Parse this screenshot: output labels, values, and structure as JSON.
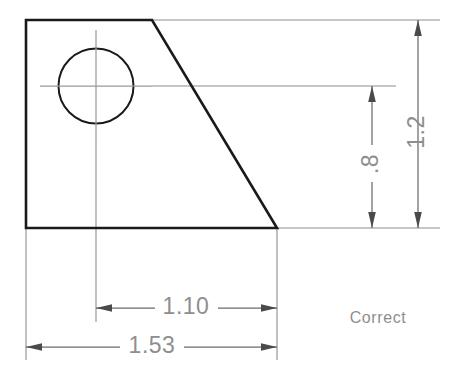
{
  "drawing": {
    "title": "Correct dimensioning example",
    "background_color": "#ffffff",
    "outline_color": "#1a1a1a",
    "dimension_color": "#8e8e8e",
    "centerline_color": "#9a9a9a"
  },
  "note": {
    "label": "Correct",
    "x": 378,
    "y": 319
  },
  "part": {
    "name": "bracket-profile",
    "vertices": [
      {
        "x": 26,
        "y": 20
      },
      {
        "x": 152,
        "y": 20
      },
      {
        "x": 277,
        "y": 228
      },
      {
        "x": 26,
        "y": 228
      }
    ],
    "points_attr": "26,20 152,20 277,228 26,228"
  },
  "hole": {
    "name": "through-hole",
    "center_x": 96,
    "center_y": 86,
    "radius": 37.5
  },
  "centerlines": {
    "horizontal": {
      "x1": 40,
      "y1": 86,
      "x2": 152,
      "y2": 86
    },
    "vertical": {
      "x1": 96,
      "y1": 30,
      "x2": 96,
      "y2": 142
    }
  },
  "extension_lines": [
    {
      "name": "top-extension",
      "x1": 152,
      "y1": 20,
      "x2": 440,
      "y2": 20
    },
    {
      "name": "center-extension",
      "x1": 152,
      "y1": 86,
      "x2": 396,
      "y2": 86
    },
    {
      "name": "bottom-extension",
      "x1": 277,
      "y1": 228,
      "x2": 440,
      "y2": 228
    },
    {
      "name": "hole-center-vertical-extension",
      "x1": 96,
      "y1": 142,
      "x2": 96,
      "y2": 322
    },
    {
      "name": "right-edge-vertical-extension",
      "x1": 277,
      "y1": 228,
      "x2": 277,
      "y2": 360
    },
    {
      "name": "left-edge-vertical-extension",
      "x1": 26,
      "y1": 228,
      "x2": 26,
      "y2": 360
    }
  ],
  "dimensions": [
    {
      "name": "overall-height",
      "value": "1.2",
      "orientation": "vertical",
      "line_x": 418,
      "y_start": 20,
      "y_end": 228,
      "text_x": 418,
      "text_y": 132,
      "rotation": -90
    },
    {
      "name": "hole-center-height",
      "value": ".8",
      "orientation": "vertical",
      "line_x": 372,
      "y_start": 86,
      "y_end": 228,
      "text_x": 372,
      "text_y": 170,
      "rotation": -90
    },
    {
      "name": "hole-to-edge-width",
      "value": "1.10",
      "orientation": "horizontal",
      "line_y": 308,
      "x_start": 96,
      "x_end": 277,
      "text_x": 186,
      "text_y": 316
    },
    {
      "name": "overall-width",
      "value": "1.53",
      "orientation": "horizontal",
      "line_y": 347,
      "x_start": 26,
      "x_end": 277,
      "text_x": 152,
      "text_y": 355
    }
  ]
}
